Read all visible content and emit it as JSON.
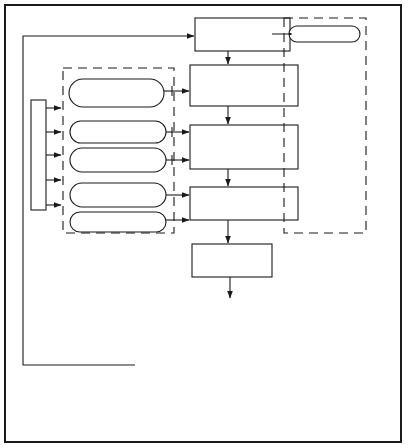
{
  "diagram": {
    "main_flow": [
      {
        "id": "identify",
        "lines": [
          "Identify",
          "improvement",
          "opportunity"
        ]
      },
      {
        "id": "organize",
        "lines": [
          "Organize QC teams",
          "that are familiar with",
          "opportunity area"
        ]
      },
      {
        "id": "develop",
        "lines": [
          "Develop and gather",
          "information pertinent",
          "to the opportunity",
          "area"
        ]
      },
      {
        "id": "find",
        "lines": [
          "Find root causes of",
          "problem"
        ]
      },
      {
        "id": "cycle",
        "lines": [
          "Improvement cycle",
          "begins"
        ]
      }
    ],
    "left_tools": [
      {
        "lines": [
          "Based on experience",
          "and / or",
          "recommendation"
        ],
        "target": "organize"
      },
      {
        "lines": [
          "Cause and effect",
          "diagram"
        ],
        "target": "develop"
      },
      {
        "lines": [
          "Checksheets, charts,",
          "graphs, etc."
        ],
        "target": "develop"
      },
      {
        "lines": [
          "Cause and effect",
          "diagram"
        ],
        "target": "find"
      },
      {
        "lines": [
          "Scatter",
          "diagram"
        ],
        "target": "find"
      }
    ],
    "right_tools": [
      {
        "lines": [
          "Brainstorming"
        ],
        "target": "identify"
      },
      {
        "lines": [
          "Brainstorming"
        ],
        "target": "organize"
      },
      {
        "lines": [
          "Brainstorming"
        ],
        "target": "develop"
      },
      {
        "lines": [
          "Flow chart"
        ],
        "target": "develop"
      },
      {
        "lines": [
          "Pareto diagram"
        ],
        "target": "find"
      },
      {
        "lines": [
          "Brainstorming"
        ],
        "target": "find"
      }
    ],
    "left_training_label": "TRAINING / EDUCATION",
    "right_training_label": "TRAINING / EDUCATION",
    "pdca": {
      "plan": "PLAN",
      "do": "DO",
      "check": "CHECK",
      "act": "ACT",
      "steps": [
        ". Reason for",
        "  improvement",
        ". Stratify problem",
        ". Analyze problem",
        ". Action measures",
        ". Results",
        ". Standardization",
        ". Future plans"
      ]
    }
  }
}
